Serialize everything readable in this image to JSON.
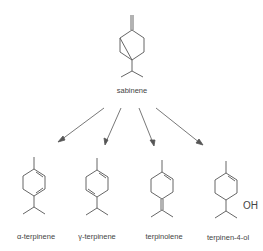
{
  "diagram": {
    "source": {
      "name": "sabinene"
    },
    "products": [
      {
        "name": "α-terpinene"
      },
      {
        "name": "γ-terpinene"
      },
      {
        "name": "terpinolene"
      },
      {
        "name": "terpinen-4-ol",
        "substituent": "OH"
      }
    ],
    "colors": {
      "line": "#555555",
      "text": "#444444"
    }
  }
}
